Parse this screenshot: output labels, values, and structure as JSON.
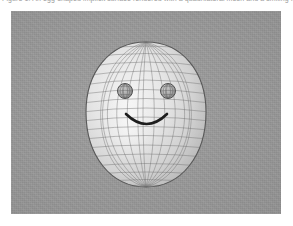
{
  "caption": {
    "text": "Figure 1. An egg-shaped implicit surface rendered with a quadrilateral mesh and a smiling face."
  },
  "panel": {
    "name": "render-viewport",
    "background_color": "#9a9a9a",
    "left": 11,
    "top": 11,
    "width": 270,
    "height": 203
  },
  "scene": {
    "title": "Shaded wireframe egg with smiley face",
    "object_name": "egg-ovoid",
    "surface_color_light": "#ececec",
    "surface_color_mid": "#d6d6d6",
    "surface_color_dark": "#a9a9a9",
    "mesh_line_color": "#6e6e6e",
    "outline_color": "#585858",
    "egg": {
      "center_x": 135,
      "center_y": 103,
      "half_width": 60,
      "top_y": 31,
      "bottom_y": 176,
      "meridians": 16,
      "parallels": 18
    },
    "eyes": [
      {
        "label": "left-eye",
        "center_x": 114,
        "center_y": 80,
        "radius": 7.5,
        "fill_color": "#b4b4b4",
        "mesh_color": "#5f5f5f"
      },
      {
        "label": "right-eye",
        "center_x": 157,
        "center_y": 80,
        "radius": 7.5,
        "fill_color": "#b4b4b4",
        "mesh_color": "#5f5f5f"
      }
    ],
    "mouth": {
      "label": "smile-arc",
      "start_x": 115,
      "start_y": 104,
      "end_x": 156,
      "end_y": 104,
      "depth_y": 122,
      "stroke_color": "#1d1d1d",
      "stroke_width": 2.6
    },
    "highlight": {
      "center_x": 118,
      "center_y": 118,
      "radius_x": 30,
      "radius_y": 42,
      "color": "#fafafa"
    }
  }
}
